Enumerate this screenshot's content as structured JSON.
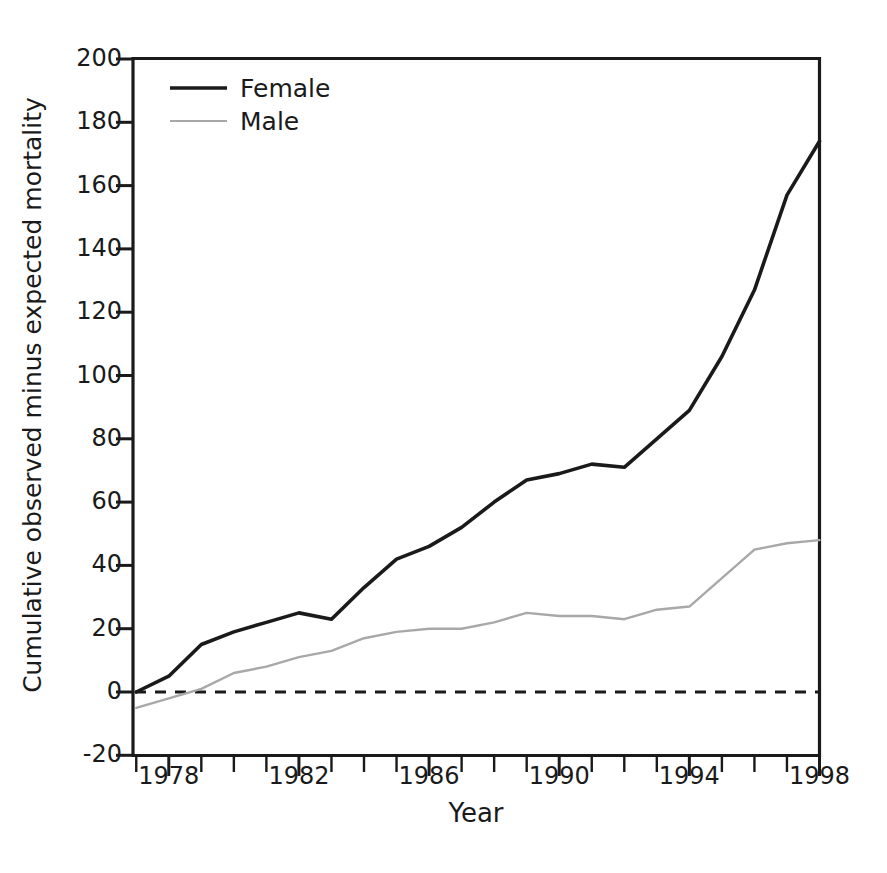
{
  "figure": {
    "title": "",
    "background_color": "#ffffff",
    "axis_color": "#1a1a1a"
  },
  "axes": {
    "xlabel": "Year",
    "ylabel": "Cumulative observed minus expected mortality",
    "x_tick_labels": [
      "1978",
      "1982",
      "1986",
      "1990",
      "1994",
      "1998"
    ],
    "y_tick_labels": [
      "200",
      "180",
      "160",
      "140",
      "120",
      "100",
      "80",
      "60",
      "40",
      "20",
      "0",
      "-20"
    ]
  },
  "legend": {
    "entries": [
      {
        "label": "Female",
        "color": "#1a1a1a",
        "width": 3.4
      },
      {
        "label": "Male",
        "color": "#a8a8a8",
        "width": 2.2
      }
    ]
  },
  "chart_data": {
    "type": "line",
    "title": "",
    "xlabel": "Year",
    "ylabel": "Cumulative observed minus expected mortality",
    "xlim": [
      1976.9,
      1998
    ],
    "ylim": [
      -20,
      200
    ],
    "xticks": [
      1978,
      1982,
      1986,
      1990,
      1994,
      1998
    ],
    "xticks_minor": [
      1977,
      1979,
      1980,
      1981,
      1983,
      1984,
      1985,
      1987,
      1988,
      1989,
      1991,
      1992,
      1993,
      1995,
      1996,
      1997
    ],
    "yticks": [
      -20,
      0,
      20,
      40,
      60,
      80,
      100,
      120,
      140,
      160,
      180,
      200
    ],
    "grid": false,
    "legend_position": "upper-left",
    "reference_line": {
      "y": 0,
      "style": "dashed",
      "color": "#1a1a1a"
    },
    "x": [
      1977,
      1978,
      1979,
      1980,
      1981,
      1982,
      1983,
      1984,
      1985,
      1986,
      1987,
      1988,
      1989,
      1990,
      1991,
      1992,
      1993,
      1994,
      1995,
      1996,
      1997,
      1998
    ],
    "series": [
      {
        "name": "Female",
        "color": "#1a1a1a",
        "values": [
          0,
          5,
          15,
          19,
          22,
          25,
          23,
          33,
          42,
          46,
          52,
          60,
          67,
          69,
          72,
          71,
          80,
          89,
          106,
          127,
          157,
          174
        ]
      },
      {
        "name": "Male",
        "color": "#a8a8a8",
        "values": [
          -5,
          -2,
          1,
          6,
          8,
          11,
          13,
          17,
          19,
          20,
          20,
          22,
          25,
          24,
          24,
          23,
          26,
          27,
          36,
          45,
          47,
          48
        ]
      }
    ]
  }
}
